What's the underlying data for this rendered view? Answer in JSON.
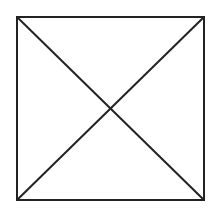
{
  "diagram": {
    "stroke_color": "#222222",
    "background_color": "#ffffff",
    "stroke_width": 2,
    "square": {
      "x1": 17,
      "y1": 17,
      "x2": 204,
      "y2": 200
    },
    "diagonals": [
      {
        "name": "top-left-to-bottom-right",
        "from": [
          17,
          17
        ],
        "to": [
          204,
          200
        ]
      },
      {
        "name": "bottom-left-to-top-right",
        "from": [
          17,
          200
        ],
        "to": [
          204,
          17
        ]
      }
    ]
  }
}
